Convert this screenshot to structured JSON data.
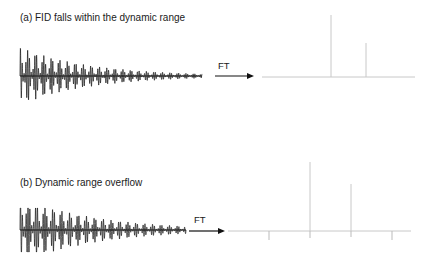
{
  "panel_a": {
    "title": "(a) FID falls within the dynamic range",
    "arrow_label": "FT",
    "fid": {
      "x_start": 20,
      "x_end": 202,
      "center_y": 76,
      "amplitude": 29,
      "cycles": 46,
      "decay": 2.6
    },
    "spectrum": {
      "baseline_y": 77,
      "x_start": 262,
      "x_end": 415,
      "peaks": [
        {
          "x": 331,
          "top": 15
        },
        {
          "x": 366,
          "top": 43
        }
      ]
    }
  },
  "panel_b": {
    "title": "(b) Dynamic range overflow",
    "arrow_label": "FT",
    "fid": {
      "x_start": 20,
      "x_end": 186,
      "center_y": 230,
      "amplitude": 25,
      "clip": 22,
      "cycles": 40,
      "decay": 2.2
    },
    "spectrum": {
      "baseline_y": 231,
      "x_start": 228,
      "x_end": 411,
      "peaks": [
        {
          "x": 310,
          "top": 162
        },
        {
          "x": 351,
          "top": 184
        }
      ],
      "artifacts": [
        {
          "x": 269,
          "y2": 240
        },
        {
          "x": 310,
          "y2": 238
        },
        {
          "x": 351,
          "y2": 237
        },
        {
          "x": 392,
          "y2": 240
        }
      ]
    }
  },
  "colors": {
    "signal": "#111111",
    "spectrum": "#c8c8c8",
    "artifact": "#bbbbbb",
    "arrow": "#111111"
  }
}
